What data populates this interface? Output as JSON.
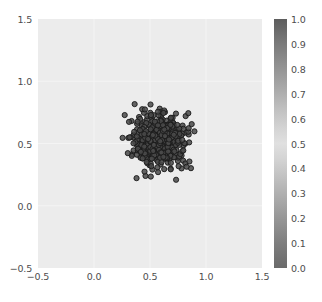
{
  "chart_data": {
    "type": "scatter",
    "title": "",
    "xlabel": "",
    "ylabel": "",
    "xlim": [
      -0.5,
      1.5
    ],
    "ylim": [
      -0.5,
      1.5
    ],
    "grid": true,
    "legend": null,
    "marker": {
      "shape": "circle",
      "size_px": 5.2,
      "facecolor": "#4a4a4a",
      "edgecolor": "#1a1a1a",
      "alpha": 0.85
    },
    "plot_background": "#ececec",
    "figure_background": "#ffffff",
    "xticks": [
      {
        "value": -0.5,
        "label": "−0.5"
      },
      {
        "value": 0.0,
        "label": "0.0"
      },
      {
        "value": 0.5,
        "label": "0.5"
      },
      {
        "value": 1.0,
        "label": "1.0"
      },
      {
        "value": 1.5,
        "label": "1.5"
      }
    ],
    "yticks": [
      {
        "value": -0.5,
        "label": "−0.5"
      },
      {
        "value": 0.0,
        "label": "0.0"
      },
      {
        "value": 0.5,
        "label": "0.5"
      },
      {
        "value": 1.0,
        "label": "1.0"
      },
      {
        "value": 1.5,
        "label": "1.5"
      }
    ],
    "cluster": {
      "center_x": 0.58,
      "center_y": 0.52,
      "std_x": 0.105,
      "std_y": 0.105,
      "n_points": 520
    },
    "colorbar": {
      "orientation": "vertical",
      "vmin": 0.0,
      "vmax": 1.0,
      "colormap": "grayscale-diverging",
      "ticks": [
        {
          "value": 1.0,
          "label": "1.0"
        },
        {
          "value": 0.9,
          "label": "0.9"
        },
        {
          "value": 0.8,
          "label": "0.8"
        },
        {
          "value": 0.7,
          "label": "0.7"
        },
        {
          "value": 0.6,
          "label": "0.6"
        },
        {
          "value": 0.5,
          "label": "0.5"
        },
        {
          "value": 0.4,
          "label": "0.4"
        },
        {
          "value": 0.3,
          "label": "0.3"
        },
        {
          "value": 0.2,
          "label": "0.2"
        },
        {
          "value": 0.1,
          "label": "0.1"
        },
        {
          "value": 0.0,
          "label": "0.0"
        }
      ]
    }
  }
}
